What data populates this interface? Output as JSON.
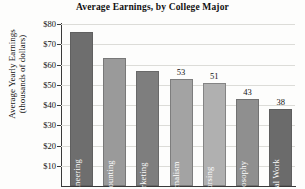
{
  "chart_data": {
    "type": "bar",
    "title": "Average Earnings, by College Major",
    "xlabel": "",
    "ylabel_line1": "Average Yearly Earnings",
    "ylabel_line2": "(thousands of dollars)",
    "ylim": [
      0,
      80
    ],
    "grid": true,
    "legend": "none",
    "ytick_labels": [
      "$80",
      "$70",
      "$60",
      "$50",
      "$40",
      "$30",
      "$20",
      "$10"
    ],
    "ytick_values": [
      80,
      70,
      60,
      50,
      40,
      30,
      20,
      10
    ],
    "categories": [
      "Engineering",
      "Accounting",
      "Marketing",
      "Journalism",
      "Nursing",
      "Philosophy",
      "Social Work"
    ],
    "values": [
      76,
      63,
      57,
      53,
      51,
      43,
      38
    ],
    "value_labels": [
      "",
      "",
      "",
      "53",
      "51",
      "43",
      "38"
    ],
    "bar_colors": [
      "#6e6e6e",
      "#9a9a9a",
      "#7e7e7e",
      "#a3a3a3",
      "#b0b0b0",
      "#8f8f8f",
      "#6b6b6b"
    ]
  }
}
